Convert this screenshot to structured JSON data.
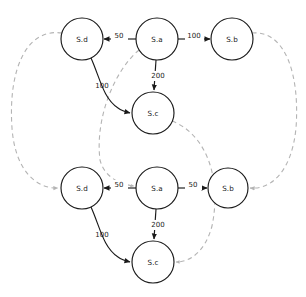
{
  "diagram": {
    "type": "directed-graph",
    "title": "",
    "canvas": {
      "width": 306,
      "height": 297
    },
    "node_radius": 21,
    "colors": {
      "node_stroke": "#1a1a1a",
      "node_fill": "#ffffff",
      "solid_edge": "#1a1a1a",
      "dashed_edge": "#b4b4b4",
      "label_text": "#1a1a1a",
      "background": "#ffffff"
    },
    "groups": [
      {
        "id": "top",
        "name": "top-graph",
        "nodes": [
          {
            "id": "top-sd",
            "label": "S.d",
            "cx": 82,
            "cy": 39
          },
          {
            "id": "top-sa",
            "label": "S.a",
            "cx": 157,
            "cy": 39
          },
          {
            "id": "top-sb",
            "label": "S.b",
            "cx": 232,
            "cy": 39
          },
          {
            "id": "top-sc",
            "label": "S.c",
            "cx": 153,
            "cy": 113
          }
        ],
        "edges": [
          {
            "id": "top-sa-sd",
            "from": "top-sa",
            "to": "top-sd",
            "label": "50",
            "label_x": 119,
            "label_y": 36
          },
          {
            "id": "top-sa-sb",
            "from": "top-sa",
            "to": "top-sb",
            "label": "100",
            "label_x": 194,
            "label_y": 36
          },
          {
            "id": "top-sa-sc",
            "from": "top-sa",
            "to": "top-sc",
            "label": "200",
            "label_x": 158,
            "label_y": 76
          },
          {
            "id": "top-sd-sc",
            "from": "top-sd",
            "to": "top-sc",
            "label": "100",
            "label_x": 102,
            "label_y": 86
          }
        ]
      },
      {
        "id": "bottom",
        "name": "bottom-graph",
        "nodes": [
          {
            "id": "bot-sd",
            "label": "S.d",
            "cx": 82,
            "cy": 188
          },
          {
            "id": "bot-sa",
            "label": "S.a",
            "cx": 157,
            "cy": 188
          },
          {
            "id": "bot-sb",
            "label": "S.b",
            "cx": 228,
            "cy": 188
          },
          {
            "id": "bot-sc",
            "label": "S.c",
            "cx": 153,
            "cy": 262
          }
        ],
        "edges": [
          {
            "id": "bot-sa-sd",
            "from": "bot-sa",
            "to": "bot-sd",
            "label": "50",
            "label_x": 119,
            "label_y": 185
          },
          {
            "id": "bot-sa-sb",
            "from": "bot-sa",
            "to": "bot-sb",
            "label": "50",
            "label_x": 193,
            "label_y": 185
          },
          {
            "id": "bot-sa-sc",
            "from": "bot-sa",
            "to": "bot-sc",
            "label": "200",
            "label_x": 158,
            "label_y": 225
          },
          {
            "id": "bot-sd-sc",
            "from": "bot-sd",
            "to": "bot-sc",
            "label": "100",
            "label_x": 102,
            "label_y": 235
          }
        ]
      }
    ],
    "mapping_edges": [
      {
        "id": "map-sd",
        "from": "top-sd",
        "to": "bot-sd",
        "label": ""
      },
      {
        "id": "map-sa",
        "from": "top-sa",
        "to": "bot-sa",
        "label": ""
      },
      {
        "id": "map-sb",
        "from": "top-sb",
        "to": "bot-sb",
        "label": ""
      },
      {
        "id": "map-sc",
        "from": "top-sc",
        "to": "bot-sc",
        "label": ""
      }
    ]
  }
}
